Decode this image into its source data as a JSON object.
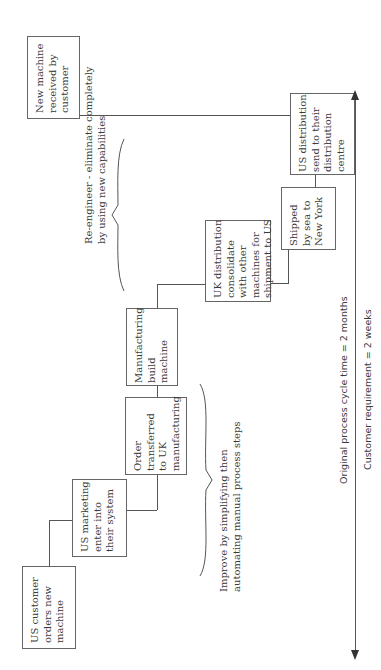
{
  "diagram": {
    "type": "process-flow",
    "orientation": "rotated-90",
    "steps": [
      {
        "id": "step1",
        "label": "US customer\norders new\nmachine"
      },
      {
        "id": "step2",
        "label": "US marketing\nenter into\ntheir system"
      },
      {
        "id": "step3",
        "label": "Order\ntransferred\nto UK\nmanufacturing"
      },
      {
        "id": "step4",
        "label": "Manufacturing\nbuild\nmachine"
      },
      {
        "id": "step5",
        "label": "UK distribution\nconsolidate\nwith other\nmachines for\nshipment to US"
      },
      {
        "id": "step6",
        "label": "Shipped\nby sea to\nNew York"
      },
      {
        "id": "step7",
        "label": "US distribution\nsend to their\ndistribution\ncentre"
      },
      {
        "id": "step8",
        "label": "New machine\nreceived by\ncustomer"
      }
    ],
    "annotations": {
      "improve": "Improve by simplifying then\nautomating manual process steps",
      "reengineer": "Re-engineer - eliminate completely\nby using new capabilities"
    },
    "timeline": {
      "original": "Original process cycle time = 2 months",
      "requirement": "Customer requirement = 2 weeks"
    }
  }
}
